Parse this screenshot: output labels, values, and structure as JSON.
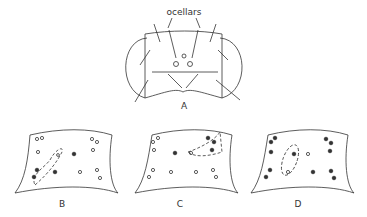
{
  "figure": {
    "annotation": "ocellars",
    "panels": [
      {
        "id": "A",
        "label": "A",
        "description": "dorsal view of head with eyes and bristles"
      },
      {
        "id": "B",
        "label": "B",
        "description": "frons diagram, dashed region lower-left"
      },
      {
        "id": "C",
        "label": "C",
        "description": "frons diagram, dashed region upper-right"
      },
      {
        "id": "D",
        "label": "D",
        "description": "frons diagram, dashed region center"
      }
    ]
  },
  "colors": {
    "line": "#333333",
    "background": "#ffffff"
  }
}
